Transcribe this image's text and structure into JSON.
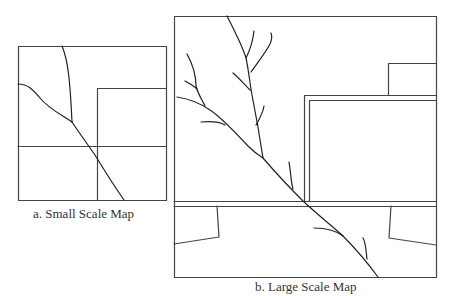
{
  "figure": {
    "panels": [
      {
        "id": "a",
        "caption": "a. Small Scale Map",
        "box": {
          "x": 18,
          "y": 46,
          "w": 148,
          "h": 154
        }
      },
      {
        "id": "b",
        "caption": "b. Large Scale Map",
        "box": {
          "x": 174,
          "y": 16,
          "w": 262,
          "h": 261
        }
      }
    ],
    "colors": {
      "stroke": "#222222",
      "frame": "#444444",
      "caption": "#333333",
      "background": "#ffffff"
    }
  }
}
